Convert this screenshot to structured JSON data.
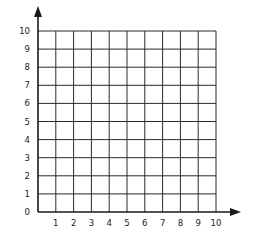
{
  "chart_data": {
    "type": "scatter",
    "title": "",
    "xlabel": "",
    "ylabel": "",
    "x_ticks": [
      "1",
      "2",
      "3",
      "4",
      "5",
      "6",
      "7",
      "8",
      "9",
      "10"
    ],
    "y_ticks": [
      "0",
      "1",
      "2",
      "3",
      "4",
      "5",
      "6",
      "7",
      "8",
      "9",
      "10"
    ],
    "xlim": [
      0,
      10
    ],
    "ylim": [
      0,
      10
    ],
    "grid": true,
    "series": [],
    "legend": null
  },
  "colors": {
    "grid": "#2a2a2a",
    "axis": "#1a1a1a",
    "background": "#ffffff"
  }
}
